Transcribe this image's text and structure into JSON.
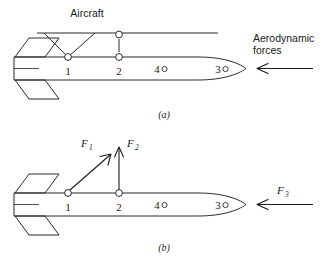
{
  "figure": {
    "title_implicit": "Missile suspended from aircraft and free-body force diagram",
    "panels": [
      {
        "id": "a",
        "caption": "(a)",
        "labels": {
          "aircraft": "Aircraft",
          "aero_line1": "Aerodynamic",
          "aero_line2": "forces"
        },
        "points": [
          "1",
          "2",
          "4",
          "3"
        ],
        "arrows": [
          {
            "name": "aerodynamic-forces-arrow",
            "direction": "left"
          }
        ]
      },
      {
        "id": "b",
        "caption": "(b)",
        "forces": [
          {
            "name": "F1",
            "base": "F",
            "sub": "1",
            "at_point": "1",
            "direction": "up-right"
          },
          {
            "name": "F2",
            "base": "F",
            "sub": "2",
            "at_point": "2",
            "direction": "up"
          },
          {
            "name": "F3",
            "base": "F",
            "sub": "3",
            "at_point": "nose",
            "direction": "left"
          }
        ],
        "points": [
          "1",
          "2",
          "4",
          "3"
        ]
      }
    ],
    "point_labels": {
      "p1": "1",
      "p2": "2",
      "p4": "4",
      "p3": "3"
    },
    "colors": {
      "ink": "#1a1a1a",
      "line": "#2a2a2a",
      "background": "#ffffff"
    }
  }
}
